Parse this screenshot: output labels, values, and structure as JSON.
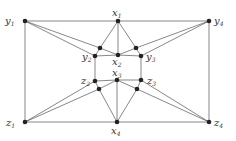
{
  "graph": {
    "nodes": [
      {
        "id": "y1",
        "x": 25,
        "y": 21,
        "label": "y",
        "sub": "1",
        "lx": 5,
        "ly": 24
      },
      {
        "id": "x1",
        "x": 118,
        "y": 21,
        "label": "x",
        "sub": "1",
        "lx": 112,
        "ly": 16
      },
      {
        "id": "y4",
        "x": 209,
        "y": 21,
        "label": "y",
        "sub": "4",
        "lx": 214,
        "ly": 24
      },
      {
        "id": "a",
        "x": 100,
        "y": 48
      },
      {
        "id": "y2",
        "x": 95,
        "y": 56,
        "label": "y",
        "sub": "2",
        "lx": 82,
        "ly": 60
      },
      {
        "id": "x2",
        "x": 118,
        "y": 55,
        "label": "x",
        "sub": "2",
        "lx": 112,
        "ly": 65
      },
      {
        "id": "b",
        "x": 136,
        "y": 48
      },
      {
        "id": "y3",
        "x": 141,
        "y": 56,
        "label": "y",
        "sub": "3",
        "lx": 146,
        "ly": 60
      },
      {
        "id": "z2",
        "x": 95,
        "y": 81,
        "label": "z",
        "sub": "2",
        "lx": 81,
        "ly": 84
      },
      {
        "id": "x3",
        "x": 117,
        "y": 80,
        "label": "x",
        "sub": "3",
        "lx": 112,
        "ly": 76
      },
      {
        "id": "z3",
        "x": 141,
        "y": 80,
        "label": "z",
        "sub": "3",
        "lx": 147,
        "ly": 84
      },
      {
        "id": "c",
        "x": 99,
        "y": 89
      },
      {
        "id": "d",
        "x": 137,
        "y": 89
      },
      {
        "id": "z1",
        "x": 25,
        "y": 122,
        "label": "z",
        "sub": "1",
        "lx": 6,
        "ly": 126
      },
      {
        "id": "x4",
        "x": 117,
        "y": 122,
        "label": "x",
        "sub": "4",
        "lx": 111,
        "ly": 134
      },
      {
        "id": "z4",
        "x": 209,
        "y": 122,
        "label": "z",
        "sub": "4",
        "lx": 214,
        "ly": 126
      }
    ],
    "edges": [
      [
        "y1",
        "x1"
      ],
      [
        "x1",
        "y4"
      ],
      [
        "y4",
        "z4"
      ],
      [
        "z4",
        "x4"
      ],
      [
        "x4",
        "z1"
      ],
      [
        "z1",
        "y1"
      ],
      [
        "x1",
        "a"
      ],
      [
        "x1",
        "x2"
      ],
      [
        "x1",
        "b"
      ],
      [
        "y1",
        "a"
      ],
      [
        "a",
        "x2"
      ],
      [
        "y1",
        "y2"
      ],
      [
        "a",
        "y2"
      ],
      [
        "y4",
        "b"
      ],
      [
        "b",
        "x2"
      ],
      [
        "y4",
        "y3"
      ],
      [
        "b",
        "y3"
      ],
      [
        "y2",
        "x2"
      ],
      [
        "x2",
        "y3"
      ],
      [
        "y2",
        "z2"
      ],
      [
        "y3",
        "z3"
      ],
      [
        "z2",
        "x3"
      ],
      [
        "x3",
        "z3"
      ],
      [
        "z1",
        "c"
      ],
      [
        "c",
        "x3"
      ],
      [
        "z1",
        "z2"
      ],
      [
        "c",
        "z2"
      ],
      [
        "z4",
        "d"
      ],
      [
        "d",
        "x3"
      ],
      [
        "z4",
        "z3"
      ],
      [
        "d",
        "z3"
      ],
      [
        "x4",
        "c"
      ],
      [
        "x4",
        "x3"
      ],
      [
        "x4",
        "d"
      ]
    ]
  }
}
